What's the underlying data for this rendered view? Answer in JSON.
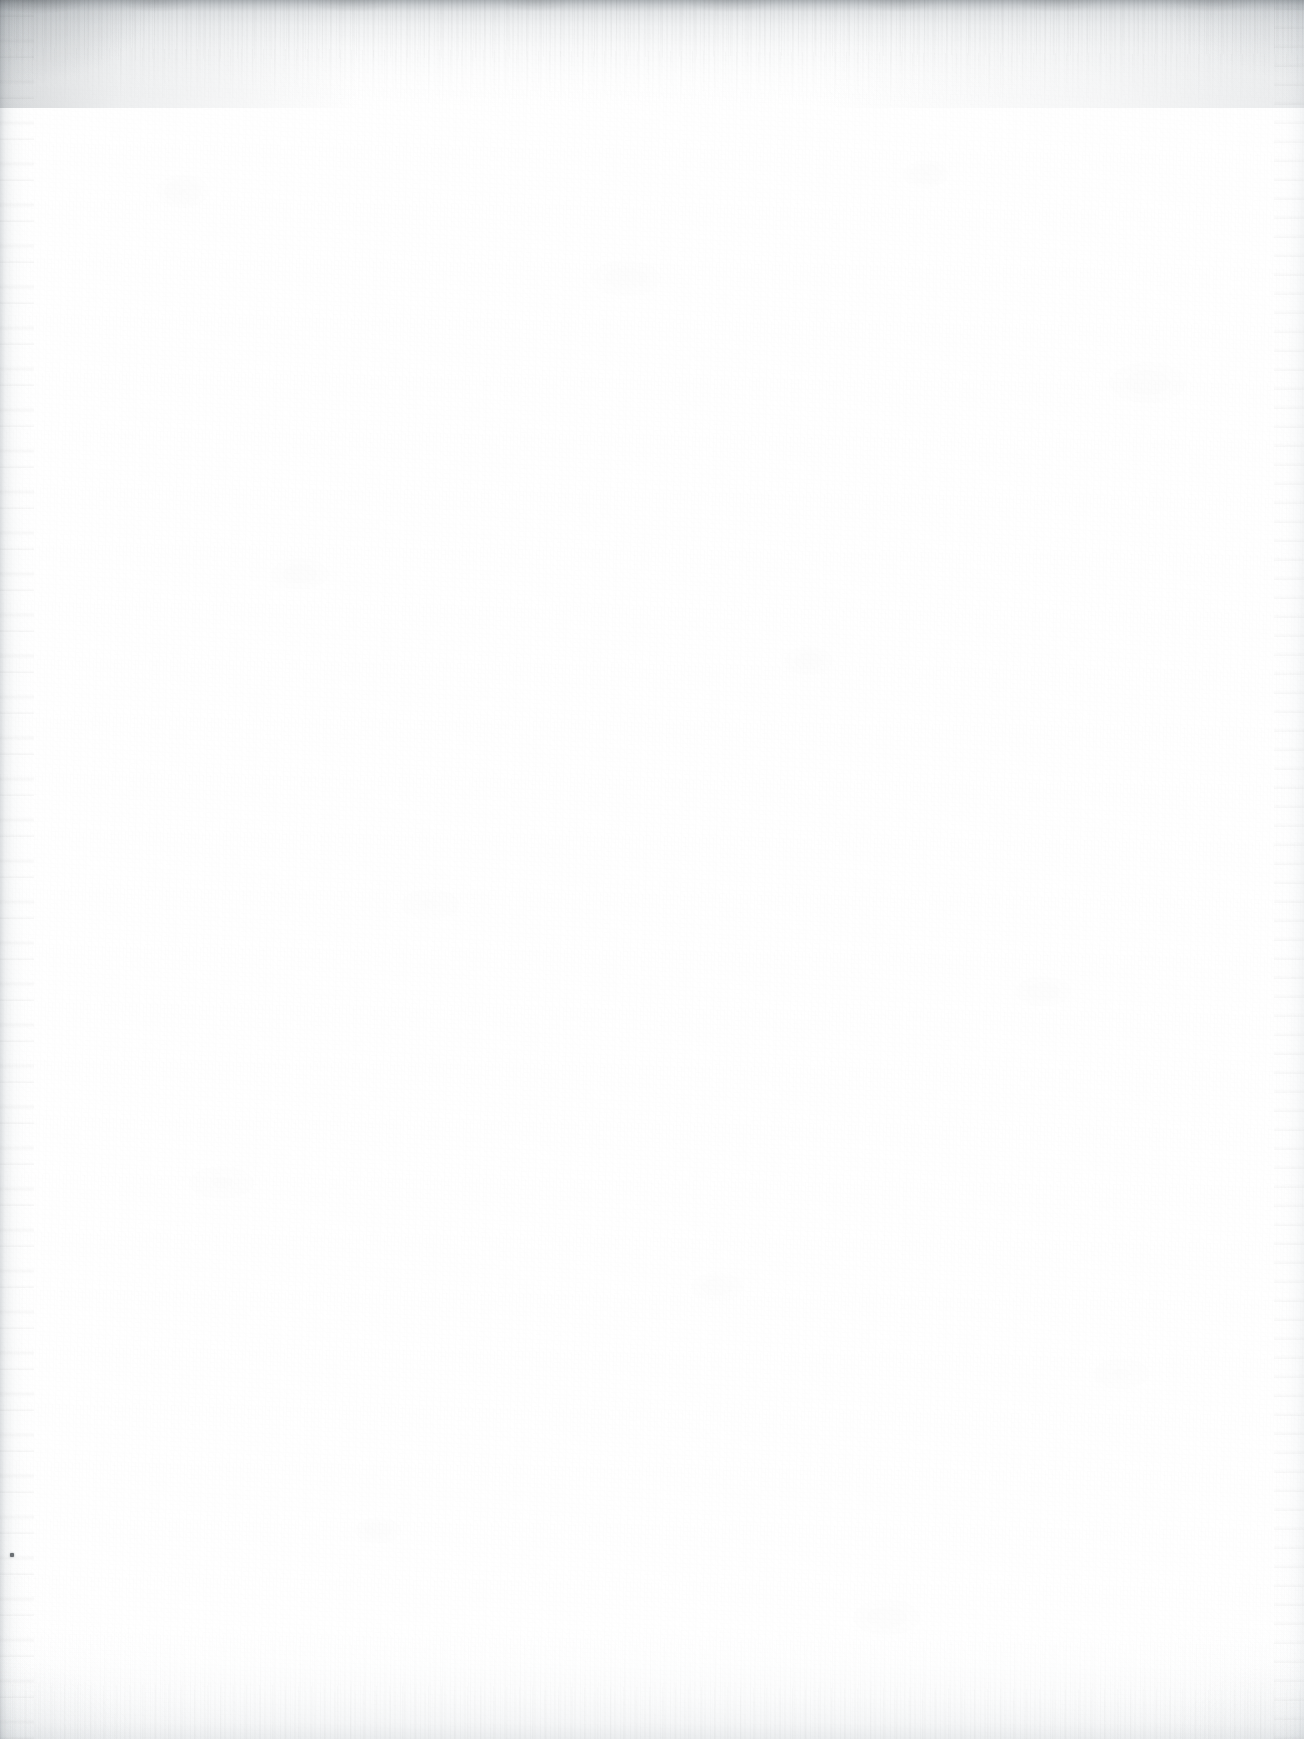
{
  "page": {
    "kind": "scanned-blank-page",
    "width_px": 1304,
    "height_px": 1739,
    "text_content": "",
    "visible_text_blocks": [],
    "colors": {
      "paper_white": "#ffffff",
      "paper_tint": "#fbfbfc",
      "top_edge_dark": "#969ca1",
      "top_edge_mid": "#c4c9cd",
      "side_edge_gray": "#b2b8bd",
      "bottom_edge_gray": "#ced3d7",
      "speck": "#4c5156"
    }
  },
  "artifacts": {
    "top_edge": {
      "name": "scan-edge-gradient-top",
      "height_px": 108,
      "note": "Dark gray rim with downward fibrous streaks fading to white"
    },
    "bottom_edge": {
      "name": "scan-edge-gradient-bottom",
      "height_px": 112,
      "note": "Lighter fibrous rise from the bottom margin"
    },
    "left_edge": {
      "name": "scan-edge-gradient-left",
      "width_px": 34,
      "note": "Faint vertical gray band running full height"
    },
    "right_edge": {
      "name": "scan-edge-gradient-right",
      "width_px": 30,
      "note": "Very faint vertical gray streak near the right border"
    },
    "specks": [
      {
        "name": "dust-speck",
        "x_px": 10,
        "y_px": 1553,
        "size_px": 4
      }
    ]
  }
}
